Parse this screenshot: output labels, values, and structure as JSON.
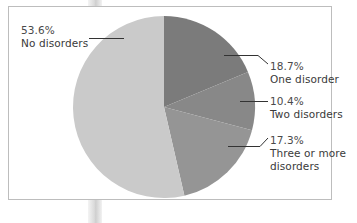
{
  "chart_data": {
    "type": "pie",
    "title": "",
    "start_angle_deg": 0,
    "direction": "clockwise",
    "slices": [
      {
        "label": "One disorder",
        "value": 18.7,
        "display": "18.7%",
        "color": "#7b7b7b"
      },
      {
        "label": "Two disorders",
        "value": 10.4,
        "display": "10.4%",
        "color": "#888888"
      },
      {
        "label": "Three or more disorders",
        "value": 17.3,
        "display": "17.3%",
        "color": "#959595"
      },
      {
        "label": "No disorders",
        "value": 53.6,
        "display": "53.6%",
        "color": "#cacaca"
      }
    ],
    "legend": "none (direct leader-line labels)"
  },
  "labels": {
    "no_disorders": {
      "pct": "53.6%",
      "name": "No disorders"
    },
    "one_disorder": {
      "pct": "18.7%",
      "name": "One disorder"
    },
    "two_disorders": {
      "pct": "10.4%",
      "name": "Two disorders"
    },
    "three_or_more": {
      "pct": "17.3%",
      "name_line1": "Three or more",
      "name_line2": "disorders"
    }
  },
  "colors": {
    "frame_border": "#bdbdbd",
    "leader_line": "#333333",
    "text": "#3a3a3a"
  }
}
